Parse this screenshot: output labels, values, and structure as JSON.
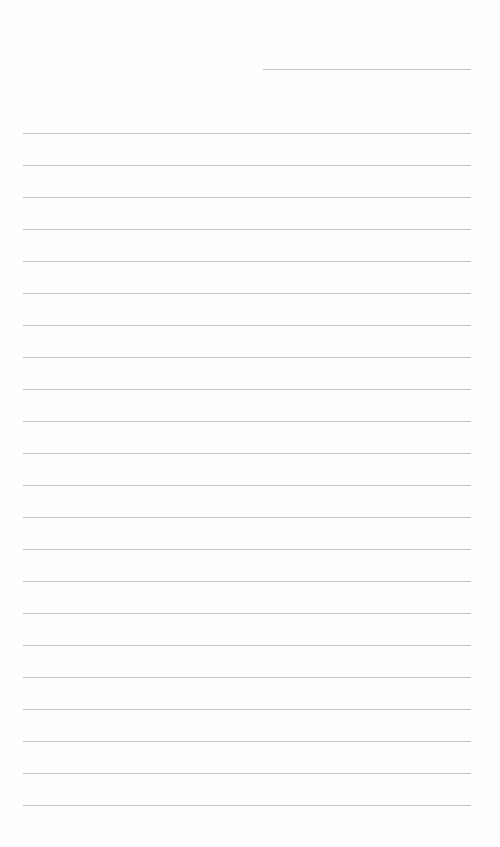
{
  "page": {
    "type": "lined-paper",
    "header_line": {
      "label": "",
      "x": 263,
      "y": 69,
      "width": 208
    },
    "rules": {
      "count": 22,
      "start_y": 133,
      "spacing": 32,
      "x": 23,
      "width": 448
    },
    "colors": {
      "background": "#fefefe",
      "line": "#c4c4c4"
    }
  }
}
